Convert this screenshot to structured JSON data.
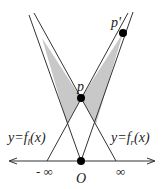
{
  "diagram": {
    "colors": {
      "line": "#333333",
      "fill": "#c8c8c8",
      "point": "#000000",
      "background": "#ffffff"
    },
    "axis": {
      "y": 161,
      "x_start": 8,
      "x_end": 156
    },
    "points": {
      "O": {
        "x": 81,
        "y": 161,
        "label": "O"
      },
      "p": {
        "x": 81,
        "y": 98,
        "label": "p"
      },
      "p_prime": {
        "x": 123,
        "y": 33,
        "label": "p'"
      }
    },
    "labels": {
      "left_function_prefix": "y=f",
      "left_function_sub": "l",
      "left_function_suffix": "(x)",
      "right_function_prefix": "y=f",
      "right_function_sub": "r",
      "right_function_suffix": "(x)",
      "neg_infinity": "- ∞",
      "pos_infinity": "∞",
      "origin": "O",
      "p": "p",
      "p_prime": "p'"
    }
  }
}
